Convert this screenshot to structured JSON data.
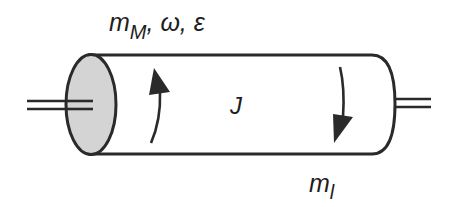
{
  "diagram": {
    "type": "rotating-cylinder",
    "labels": {
      "top": {
        "symbol": "m",
        "subscript": "M",
        "rest": ", ω, ε"
      },
      "center": "J",
      "bottom": {
        "symbol": "m",
        "subscript": "l"
      }
    },
    "arrows": [
      {
        "name": "motor-torque-arrow",
        "direction": "up"
      },
      {
        "name": "load-torque-arrow",
        "direction": "down"
      }
    ],
    "colors": {
      "stroke": "#2a2a2a",
      "end_cap_fill": "#d4d4d4",
      "background": "#ffffff"
    }
  }
}
